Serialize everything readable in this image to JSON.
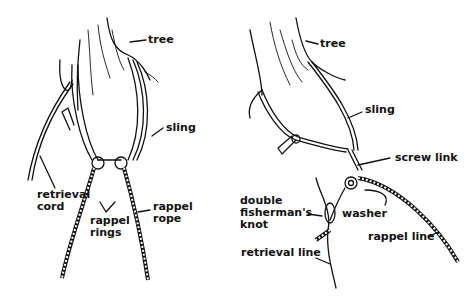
{
  "diagrams": [
    {
      "id": "left",
      "labels": {
        "tree": "tree",
        "sling": "sling",
        "retrieval_cord_1": "retrieval",
        "retrieval_cord_2": "cord",
        "rappel_rings_1": "rappel",
        "rappel_rings_2": "rings",
        "rappel_rope_1": "rappel",
        "rappel_rope_2": "rope"
      }
    },
    {
      "id": "right",
      "labels": {
        "tree": "tree",
        "sling": "sling",
        "screw_link": "screw link",
        "double_fishermans_1": "double",
        "double_fishermans_2": "fisherman's",
        "double_fishermans_3": "knot",
        "washer": "washer",
        "rappel_line": "rappel line",
        "retrieval_line": "retrieval line"
      }
    }
  ],
  "colors": {
    "ink": "#111111",
    "background": "#ffffff"
  }
}
